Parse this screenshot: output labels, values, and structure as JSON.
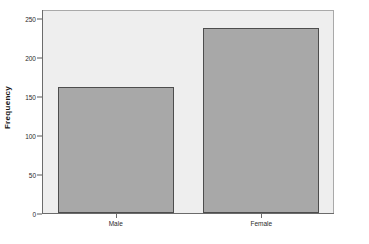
{
  "chart_data": {
    "type": "bar",
    "title": "",
    "subtitle": "",
    "xlabel": "",
    "ylabel": "Frequency",
    "categories": [
      "Male",
      "Female"
    ],
    "values": [
      162,
      238
    ],
    "series": [
      {
        "name": "Frequency",
        "values": [
          162,
          238
        ]
      }
    ],
    "ylim": [
      0,
      262
    ],
    "yticks": [
      0,
      50,
      100,
      150,
      200,
      250
    ],
    "ytick_labels": [
      "0",
      "50",
      "100",
      "150",
      "200",
      "250"
    ],
    "xtick_labels": [
      "Male",
      "Female"
    ],
    "grid": false,
    "legend": false,
    "legend_position": "none",
    "colors": {
      "bar_fill": "#a8a8a8",
      "bar_border": "#4d4d4d",
      "panel_background": "#eeeeee",
      "panel_border": "#a9a9a9",
      "axis": "#6b6b6b",
      "text": "#2b2b2b",
      "figure_background": "#ffffff"
    }
  }
}
